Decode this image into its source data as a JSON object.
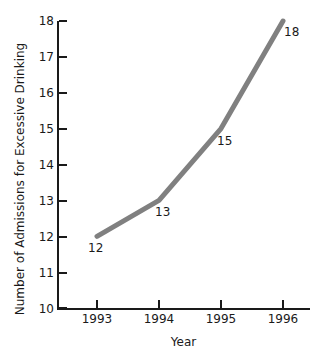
{
  "chart_data": {
    "type": "line",
    "title": "",
    "xlabel": "Year",
    "ylabel": "Number of Admissions for Excessive Drinking",
    "categories": [
      "1993",
      "1994",
      "1995",
      "1996"
    ],
    "x": [
      1993,
      1994,
      1995,
      1996
    ],
    "values": [
      12,
      13,
      15,
      18
    ],
    "point_labels": [
      "12",
      "13",
      "15",
      "18"
    ],
    "xlim": [
      1993,
      1996
    ],
    "ylim": [
      10,
      18
    ],
    "y_ticks": [
      "18",
      "17",
      "16",
      "15",
      "14",
      "13",
      "12",
      "11",
      "10"
    ],
    "x_ticks": [
      "1993",
      "1994",
      "1995",
      "1996"
    ],
    "grid": false,
    "legend": false,
    "series": [
      {
        "name": "Admissions for Excessive Drinking",
        "values": [
          12,
          13,
          15,
          18
        ],
        "color": "#808080"
      }
    ],
    "colors": {
      "line": "#808080",
      "axis": "#1a1a1a",
      "text": "#1a1a1a",
      "background": "#ffffff"
    }
  }
}
